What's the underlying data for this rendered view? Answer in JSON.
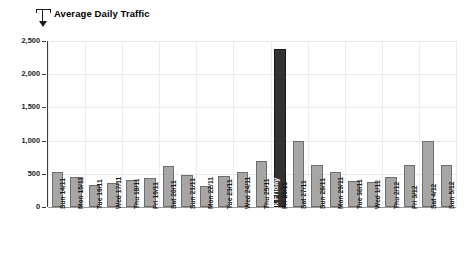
{
  "chart_data": {
    "type": "bar",
    "title": "Average Daily Traffic",
    "xlabel": "",
    "ylabel": "",
    "ylim": [
      0,
      2500
    ],
    "yticks": [
      "0",
      "500",
      "1,000",
      "1,500",
      "2,000",
      "2,500"
    ],
    "ytick_values": [
      0,
      500,
      1000,
      1500,
      2000,
      2500
    ],
    "grid": true,
    "legend": "none",
    "bar_color": "#a6a6a6",
    "bar_border_color": "#6e6e6e",
    "highlight_color": "#333333",
    "categories": [
      "Sun 14/11",
      "Mon 15/11",
      "Tue 16/11",
      "Wed 17/11",
      "Thu 18/11",
      "Fri 19/11",
      "Sat 20/11",
      "Sun 21/11",
      "Mon 22/11",
      "Tue 23/11",
      "Wed 24/11",
      "Thu 25/11",
      "Fri 26/11",
      "Sat 27/11",
      "Sun 28/11",
      "Mon 29/11",
      "Tue 30/11",
      "Wed 1/12",
      "Thu 2/12",
      "Fri 3/12",
      "Sat 4/12",
      "Sun 5/12"
    ],
    "values": [
      520,
      450,
      330,
      360,
      400,
      440,
      620,
      480,
      320,
      470,
      520,
      700,
      2380,
      1000,
      640,
      520,
      390,
      370,
      450,
      630,
      990,
      630
    ],
    "annotations": [
      {
        "index": 12,
        "text": "Black Friday",
        "orientation": "vertical",
        "color": "#ffffff"
      }
    ]
  },
  "header": {
    "title": "Average Daily Traffic",
    "pointer_icon": "callout-pointer-icon"
  }
}
